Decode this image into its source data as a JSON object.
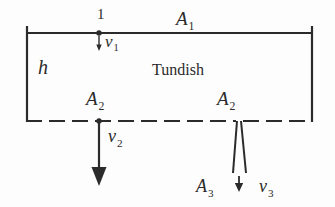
{
  "figure": {
    "background_color": "#fdfdfd",
    "ink_color": "#2b2b2b"
  },
  "labels": {
    "area_top": "A",
    "area_top_sub": "1",
    "point_one": "1",
    "velocity_top": "v",
    "velocity_top_sub": "1",
    "height": "h",
    "vessel_name": "Tundish",
    "area_outlet_left": "A",
    "area_outlet_left_sub": "2",
    "area_outlet_right": "A",
    "area_outlet_right_sub": "2",
    "velocity_outlet": "v",
    "velocity_outlet_sub": "2",
    "area_nozzle": "A",
    "area_nozzle_sub": "3",
    "velocity_nozzle": "v",
    "velocity_nozzle_sub": "3"
  },
  "geometry": {
    "top_line_y": 33,
    "bottom_line_y": 121,
    "left_wall_x": 26,
    "right_wall_x": 313,
    "dot_top_x": 99,
    "dot_bottom_x": 99,
    "nozzle_x": 239
  }
}
